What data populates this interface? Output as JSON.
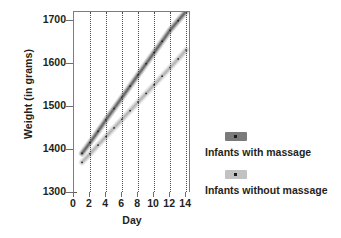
{
  "chart_data": {
    "type": "line",
    "title": "",
    "xlabel": "Day",
    "ylabel": "Weight (in grams)",
    "xlim": [
      0,
      14.6
    ],
    "ylim": [
      1300,
      1720
    ],
    "xticks": [
      0,
      2,
      4,
      6,
      8,
      10,
      12,
      14
    ],
    "xtick_labels": [
      "0",
      "2",
      "4",
      "6",
      "8",
      "10",
      "12",
      "14"
    ],
    "yticks": [
      1300,
      1400,
      1500,
      1600,
      1700
    ],
    "ytick_labels": [
      "1300",
      "1400",
      "1500",
      "1600",
      "1700"
    ],
    "grid": "vertical-dotted",
    "legend_position": "right",
    "x": [
      1,
      2,
      3,
      4,
      5,
      6,
      7,
      8,
      9,
      10,
      11,
      12,
      13,
      14
    ],
    "series": [
      {
        "name": "Infants with massage",
        "color": "#6b6b6b",
        "values": [
          1392,
          1417,
          1443,
          1470,
          1496,
          1522,
          1548,
          1574,
          1600,
          1626,
          1652,
          1678,
          1700,
          1722
        ]
      },
      {
        "name": "Infants without massage",
        "color": "#b8b8b8",
        "values": [
          1371,
          1391,
          1411,
          1431,
          1451,
          1471,
          1491,
          1511,
          1531,
          1551,
          1571,
          1591,
          1611,
          1632
        ]
      }
    ]
  },
  "legend": {
    "items": [
      {
        "label": "Infants with massage",
        "swatch_color": "#7a7a7a"
      },
      {
        "label": "Infants without massage",
        "swatch_color": "#c2c2c2"
      }
    ]
  },
  "colors": {
    "axis": "#6e6e6e",
    "grid": "#4a4a4a",
    "text": "#231f20",
    "background": "#ffffff"
  }
}
